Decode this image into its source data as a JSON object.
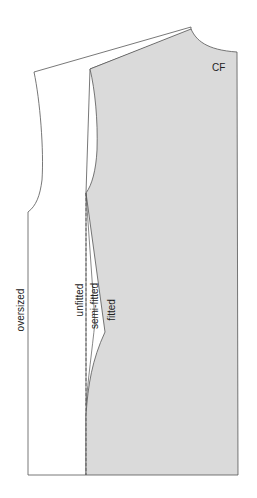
{
  "diagram": {
    "title": "",
    "colors": {
      "fitted_fill": "#dadada",
      "outline": "#555555",
      "background": "#ffffff"
    },
    "labels": {
      "center_front": "CF",
      "oversized": "oversized",
      "unfitted": "unfitted",
      "semi_fitted": "semi-fitted",
      "fitted": "fitted"
    }
  }
}
